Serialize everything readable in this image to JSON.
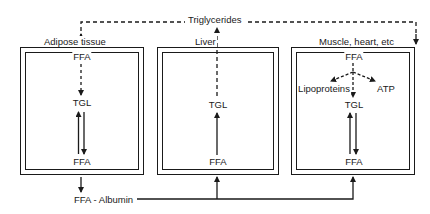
{
  "diagram": {
    "top_flow_label": "Triglycerides",
    "compartments": [
      {
        "id": "adipose",
        "label": "Adipose tissue",
        "nodes": {
          "top": "FFA",
          "middle": "TGL",
          "bottom": "FFA"
        }
      },
      {
        "id": "liver",
        "label": "Liver",
        "nodes": {
          "middle": "TGL",
          "bottom": "FFA"
        }
      },
      {
        "id": "muscle",
        "label": "Muscle, heart, etc",
        "nodes": {
          "top": "FFA",
          "left_branch": "Lipoproteins",
          "right_branch": "ATP",
          "middle": "TGL",
          "bottom": "FFA"
        }
      }
    ],
    "blood_carrier": "FFA - Albumin",
    "colors": {
      "line": "#1a1a1a",
      "background": "#ffffff"
    }
  }
}
